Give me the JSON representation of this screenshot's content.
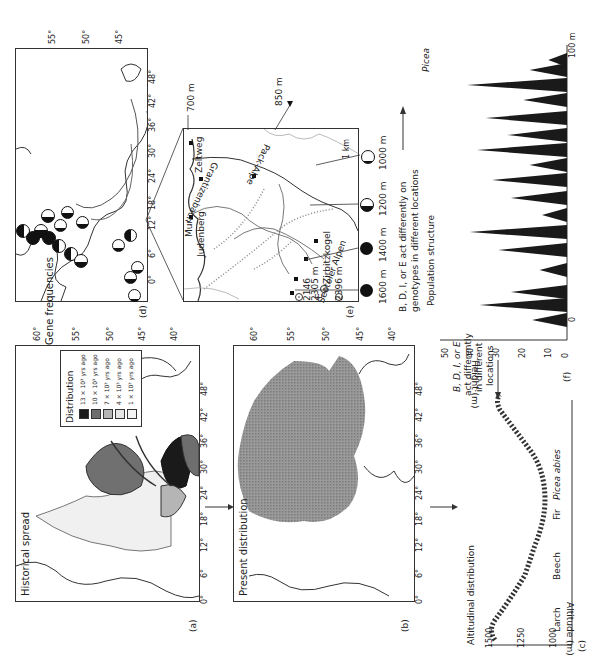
{
  "figure": {
    "panels": {
      "a": {
        "letter": "(a)",
        "title": "Historical spread",
        "legend_title": "Distribution",
        "legend": [
          {
            "label": "13 × 10³ yrs ago",
            "color": "#1a1a1a"
          },
          {
            "label": "10 × 10³ yrs ago",
            "color": "#6e6e6e"
          },
          {
            "label": "7 × 10³ yrs ago",
            "color": "#b5b5b5"
          },
          {
            "label": "4 × 10³ yrs ago",
            "color": "#e6e6e6"
          },
          {
            "label": "1 × 10³ yrs ago",
            "color": "#f3f3f3"
          }
        ],
        "lon_ticks": [
          "0°",
          "6°",
          "12°",
          "18°",
          "24°",
          "30°",
          "36°",
          "42°",
          "48°"
        ],
        "lat_ticks": [
          "60°",
          "55°",
          "50°",
          "45°",
          "40°"
        ]
      },
      "b": {
        "letter": "(b)",
        "title": "Present distribution",
        "lon_ticks": [
          "0°",
          "6°",
          "12°",
          "18°",
          "24°",
          "30°",
          "36°",
          "42°",
          "48°"
        ],
        "lat_ticks": [
          "60°",
          "55°",
          "50°",
          "45°",
          "40°"
        ]
      },
      "c": {
        "letter": "(c)",
        "title": "Altitudinal distribution",
        "ylabel": "Altitude (m)",
        "y_ticks": [
          "1500",
          "1250",
          "1000"
        ],
        "species": [
          "Larch",
          "Beech",
          "Fir",
          "Picea abies"
        ],
        "annotation": [
          "B, D, I, or E",
          "act differently",
          "in different",
          "locations"
        ]
      },
      "d": {
        "letter": "(d)",
        "title": "Gene frequencies",
        "lon_ticks": [
          "0°",
          "6°",
          "12°",
          "18°",
          "24°",
          "30°",
          "36°",
          "42°",
          "48°"
        ],
        "lat_ticks": [
          "55°",
          "50°",
          "45°"
        ]
      },
      "e": {
        "letter": "(e)",
        "places": [
          "Zeltweg",
          "Mur",
          "Judenberg",
          "Grantizenbach",
          "Pack-Alpe",
          "Seetoler Alpen",
          "Zirbitzkogel"
        ],
        "peaks": [
          "2146",
          "2305 m",
          "2396 m"
        ],
        "peak_marker": "E",
        "elevations": [
          "1600 m",
          "1400 m",
          "1200 m",
          "1000 m",
          "850 m",
          "700 m"
        ],
        "scale": "1 km"
      },
      "f": {
        "letter": "(f)",
        "title": "Population structure",
        "ylabel": "Height (m)",
        "y_ticks": [
          "50",
          "40",
          "30",
          "20",
          "10",
          "0"
        ],
        "x_start": "0",
        "x_end": "100 m",
        "species_label": "Picea",
        "annotation": [
          "B, D, I, or E act differently on",
          "genotypes in different locations"
        ]
      }
    }
  }
}
